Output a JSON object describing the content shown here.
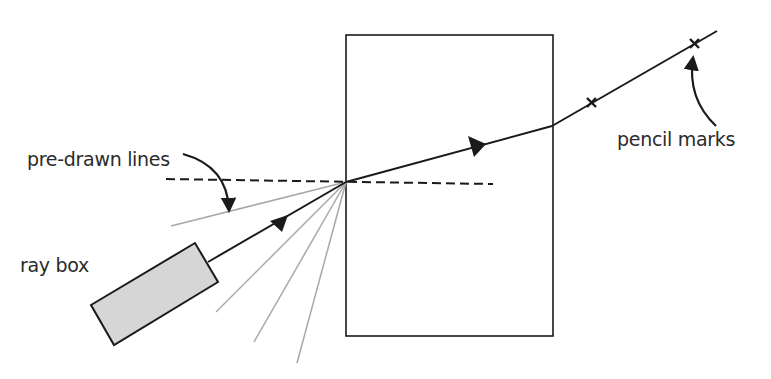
{
  "diagram": {
    "labels": {
      "pre_drawn_lines": "pre-drawn lines",
      "ray_box": "ray box",
      "pencil_marks": "pencil marks"
    },
    "colors": {
      "ink": "#1a1a1a",
      "guide_lines": "#a8a8a8",
      "ray_box_fill": "#d6d6d6",
      "background": "#ffffff"
    },
    "elements": {
      "glass_block": {
        "x1": 346,
        "y1": 35,
        "x2": 553,
        "y2": 336
      },
      "incidence_point": {
        "x": 346,
        "y": 182
      },
      "exit_point": {
        "x": 552,
        "y": 126
      },
      "normal_line": {
        "x1": 166,
        "y1": 179,
        "x2": 493,
        "y2": 184,
        "style": "dashed"
      },
      "pencil_mark_count": 2,
      "pre_drawn_guide_count": 4
    }
  }
}
